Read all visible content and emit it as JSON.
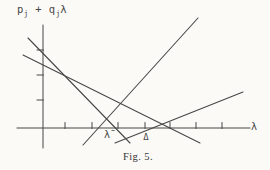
{
  "figure": {
    "caption": "Fig. 5.",
    "x_axis_label": "λ",
    "y_axis_label": {
      "base1": "p",
      "sub1": "j",
      "op": " + ",
      "base2": "q",
      "sub2": "j",
      "tail": "λ"
    },
    "colors": {
      "ink": "#474747",
      "paper": "#fbfaf7"
    },
    "axes": {
      "x_axis": {
        "x1": 17,
        "y1": 128,
        "x2": 250,
        "y2": 128
      },
      "y_axis": {
        "x1": 43,
        "y1": 25,
        "x2": 43,
        "y2": 148
      }
    },
    "x_ticks": [
      65,
      92,
      118,
      145,
      170,
      196,
      222
    ],
    "y_ticks": [
      50,
      75,
      100
    ],
    "lines": [
      {
        "name": "fn-line-steep-descending",
        "x1": 28,
        "y1": 38,
        "x2": 130,
        "y2": 143
      },
      {
        "name": "fn-line-shallow-descending",
        "x1": 23,
        "y1": 55,
        "x2": 200,
        "y2": 143
      },
      {
        "name": "fn-line-steep-ascending",
        "x1": 83,
        "y1": 145,
        "x2": 198,
        "y2": 18
      },
      {
        "name": "fn-line-shallow-ascending",
        "x1": 115,
        "y1": 143,
        "x2": 243,
        "y2": 92
      }
    ],
    "axis_markers": [
      {
        "label": "λ̄",
        "x": 107,
        "y": 130,
        "kind": "lambda-bar"
      },
      {
        "label": "Δ",
        "x": 146,
        "y": 133,
        "kind": "delta"
      }
    ]
  }
}
